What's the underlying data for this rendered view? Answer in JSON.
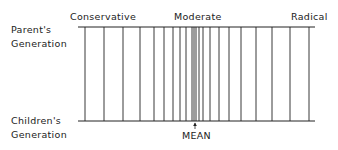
{
  "labels": {
    "conservative": "Conservative",
    "moderate": "Moderate",
    "radical": "Radical",
    "parents_line1": "Parent's",
    "parents_line2": "Generation",
    "children_line1": "Children's",
    "children_line2": "Generation",
    "mean": "MEAN"
  },
  "axis": {
    "x_start": 78,
    "x_end": 315,
    "top_y": 27,
    "bottom_y": 121
  },
  "lines_x": [
    85,
    104,
    123,
    140,
    154,
    164,
    173,
    180,
    186,
    192,
    194,
    196,
    199,
    203,
    210,
    219,
    229,
    241,
    256,
    272,
    290,
    309
  ],
  "mean_x": 195,
  "colors": {
    "ink": "#222222"
  }
}
